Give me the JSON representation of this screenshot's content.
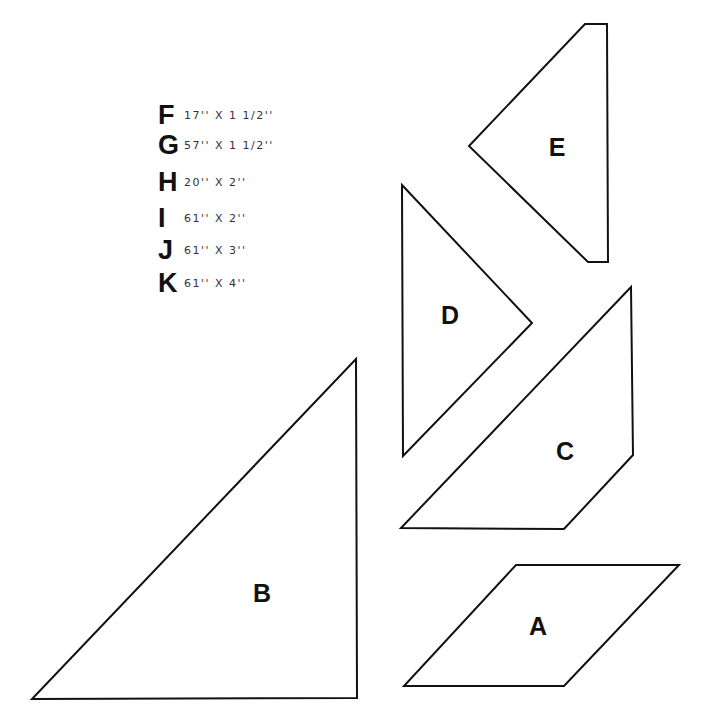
{
  "diagram": {
    "canvas": {
      "width": 712,
      "height": 722,
      "background": "#ffffff",
      "stroke": "#111111"
    },
    "cut_list": [
      {
        "letter": "F",
        "dimensions": "17'' X 1 1/2''",
        "y": 10
      },
      {
        "letter": "G",
        "dimensions": "57'' X 1 1/2''",
        "y": 40
      },
      {
        "letter": "H",
        "dimensions": "20'' X 2''",
        "y": 77
      },
      {
        "letter": "I",
        "dimensions": "61'' X 2''",
        "y": 113
      },
      {
        "letter": "J",
        "dimensions": "61'' X 3''",
        "y": 145
      },
      {
        "letter": "K",
        "dimensions": "61'' X 4''",
        "y": 178
      }
    ],
    "pieces": [
      {
        "label": "A",
        "shape": "parallelogram",
        "points": "516,565 679,565 564,686 404,686",
        "label_x": 538,
        "label_y": 626
      },
      {
        "label": "B",
        "shape": "right-triangle",
        "points": "356,359 357,698 32,699",
        "label_x": 262,
        "label_y": 593
      },
      {
        "label": "C",
        "shape": "trapezoid",
        "points": "631,287 633,455 564,529 401,528",
        "label_x": 565,
        "label_y": 451
      },
      {
        "label": "D",
        "shape": "triangle",
        "points": "402,185 532,323 403,456",
        "label_x": 450,
        "label_y": 315
      },
      {
        "label": "E",
        "shape": "truncated-triangle",
        "points": "585,24 607,24 608,262 588,262 469,146",
        "label_x": 557,
        "label_y": 147
      }
    ]
  }
}
